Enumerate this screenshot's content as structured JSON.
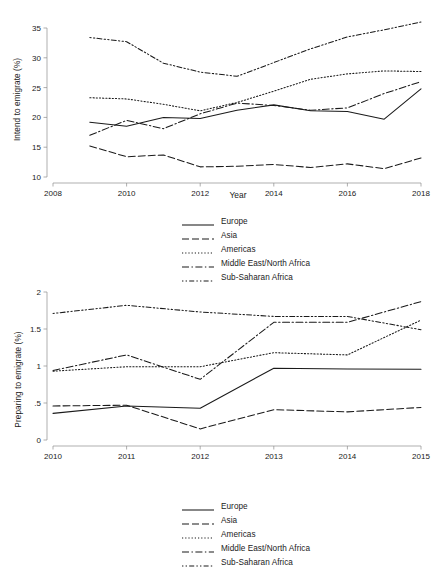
{
  "figure": {
    "background_color": "#ffffff",
    "line_color": "#1a1a1a",
    "axis_color": "#8c8c8c"
  },
  "legend_items": [
    {
      "label": "Europe",
      "dash_name": "solid",
      "dash": "none"
    },
    {
      "label": "Asia",
      "dash_name": "long-dash",
      "dash": "7,3"
    },
    {
      "label": "Americas",
      "dash_name": "dotted",
      "dash": "1.2,2"
    },
    {
      "label": "Middle East/North Africa",
      "dash_name": "dash-dot",
      "dash": "7,2.5,1.4,2.5"
    },
    {
      "label": "Sub-Saharan Africa",
      "dash_name": "dash-dot-dot",
      "dash": "1.4,2.2,1.4,2.2,5,2.2"
    }
  ],
  "chart_data": [
    {
      "id": "intend-to-emigrate",
      "type": "line",
      "title": "",
      "xlabel": "Year",
      "ylabel": "Intend to emigrate (%)",
      "xlim": [
        2008,
        2018
      ],
      "ylim": [
        10,
        35
      ],
      "xticks": [
        2008,
        2010,
        2012,
        2014,
        2016,
        2018
      ],
      "xticklabels": [
        "2008",
        "2010",
        "2012",
        "2014",
        "2016",
        "2018"
      ],
      "yticks": [
        10,
        15,
        20,
        25,
        30,
        35
      ],
      "yticklabels": [
        "10",
        "15",
        "20",
        "25",
        "30",
        "35"
      ],
      "grid": false,
      "legend_position": "below",
      "x": [
        2009,
        2010,
        2011,
        2012,
        2013,
        2014,
        2015,
        2016,
        2017,
        2018
      ],
      "series": [
        {
          "name": "Europe",
          "dash": "none",
          "values": [
            19.2,
            18.5,
            20.0,
            19.8,
            21.2,
            22.1,
            21.1,
            21.0,
            19.7,
            24.8
          ]
        },
        {
          "name": "Asia",
          "dash": "7,3",
          "values": [
            15.2,
            13.4,
            13.7,
            11.7,
            11.8,
            12.1,
            11.6,
            12.2,
            11.4,
            13.2
          ]
        },
        {
          "name": "Americas",
          "dash": "1.2,2",
          "values": [
            23.3,
            23.1,
            22.2,
            21.1,
            22.5,
            24.4,
            26.4,
            27.3,
            27.8,
            27.7
          ]
        },
        {
          "name": "Middle East/North Africa",
          "dash": "7,2.5,1.4,2.5",
          "values": [
            17.0,
            19.5,
            18.1,
            20.6,
            22.4,
            22.0,
            21.2,
            21.6,
            24.0,
            26.0
          ]
        },
        {
          "name": "Sub-Saharan Africa",
          "dash": "1.4,2.2,1.4,2.2,5,2.2",
          "values": [
            33.4,
            32.7,
            29.1,
            27.6,
            26.9,
            29.2,
            31.5,
            33.5,
            34.7,
            36.0
          ]
        }
      ]
    },
    {
      "id": "preparing-to-emigrate",
      "type": "line",
      "title": "",
      "xlabel": "Year",
      "ylabel": "Preparing to emigrate (%)",
      "xlim": [
        2010,
        2015
      ],
      "ylim": [
        0,
        2
      ],
      "xticks": [
        2010,
        2011,
        2012,
        2013,
        2014,
        2015
      ],
      "xticklabels": [
        "2010",
        "2011",
        "2012",
        "2013",
        "2014",
        "2015"
      ],
      "yticks": [
        0,
        0.5,
        1,
        1.5,
        2
      ],
      "yticklabels": [
        "0",
        ".5",
        "1",
        "1.5",
        "2"
      ],
      "grid": false,
      "legend_position": "below",
      "x": [
        2010,
        2011,
        2012,
        2013,
        2014,
        2015
      ],
      "series": [
        {
          "name": "Europe",
          "dash": "none",
          "values": [
            0.36,
            0.46,
            0.43,
            0.97,
            0.96,
            0.955
          ]
        },
        {
          "name": "Asia",
          "dash": "7,3",
          "values": [
            0.46,
            0.47,
            0.15,
            0.41,
            0.38,
            0.44
          ]
        },
        {
          "name": "Americas",
          "dash": "1.2,2",
          "values": [
            0.93,
            0.99,
            0.99,
            1.18,
            1.15,
            1.62
          ]
        },
        {
          "name": "Middle East/North Africa",
          "dash": "7,2.5,1.4,2.5",
          "values": [
            0.94,
            1.15,
            0.82,
            1.59,
            1.59,
            1.87
          ]
        },
        {
          "name": "Sub-Saharan Africa",
          "dash": "1.4,2.2,1.4,2.2,5,2.2",
          "values": [
            1.71,
            1.82,
            1.73,
            1.67,
            1.67,
            1.49
          ]
        }
      ]
    }
  ]
}
